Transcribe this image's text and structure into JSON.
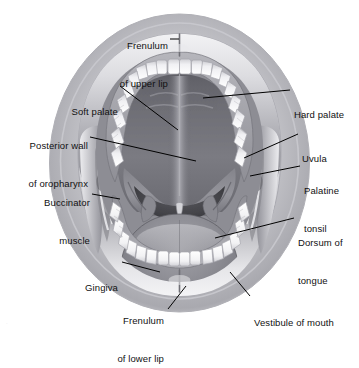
{
  "figure": {
    "type": "anatomical-illustration",
    "style": "grayscale medical illustration",
    "colors": {
      "background": "#ffffff",
      "label_text": "#111111",
      "leader_line": "#000000",
      "lip_light": "#e4e4e6",
      "lip_mid": "#b9b9bd",
      "lip_dark": "#7e7e84",
      "mucosa_mid": "#9a9aa0",
      "mucosa_dark": "#6e6e74",
      "palate_dark": "#636369",
      "tongue_mid": "#8d8d93",
      "tooth": "#fbfbfb",
      "tooth_shadow": "#cfcfd3",
      "cavity_black": "#3a3a3f"
    }
  },
  "labels": [
    {
      "id": "frenulum-upper-lip",
      "lines": [
        "Frenulum",
        "of upper lip"
      ],
      "side": "top",
      "align": "right"
    },
    {
      "id": "soft-palate",
      "lines": [
        "Soft palate"
      ],
      "side": "left",
      "align": "right"
    },
    {
      "id": "posterior-wall-oropharynx",
      "lines": [
        "Posterior wall",
        "of oropharynx"
      ],
      "side": "left",
      "align": "right"
    },
    {
      "id": "buccinator-muscle",
      "lines": [
        "Buccinator",
        "muscle"
      ],
      "side": "left",
      "align": "right"
    },
    {
      "id": "gingiva",
      "lines": [
        "Gingiva"
      ],
      "side": "left",
      "align": "right"
    },
    {
      "id": "frenulum-lower-lip",
      "lines": [
        "Frenulum",
        "of lower lip"
      ],
      "side": "bottom",
      "align": "right"
    },
    {
      "id": "hard-palate",
      "lines": [
        "Hard palate"
      ],
      "side": "right",
      "align": "left"
    },
    {
      "id": "uvula",
      "lines": [
        "Uvula"
      ],
      "side": "right",
      "align": "left"
    },
    {
      "id": "palatine-tonsil",
      "lines": [
        "Palatine",
        "tonsil"
      ],
      "side": "right",
      "align": "left"
    },
    {
      "id": "dorsum-of-tongue",
      "lines": [
        "Dorsum of",
        "tongue"
      ],
      "side": "right",
      "align": "left"
    },
    {
      "id": "vestibule-of-mouth",
      "lines": [
        "Vestibule of mouth"
      ],
      "side": "bottom",
      "align": "left"
    }
  ],
  "label_text": {
    "frenulum_upper_lip_1": "Frenulum",
    "frenulum_upper_lip_2": "of upper lip",
    "soft_palate": "Soft palate",
    "posterior_wall_1": "Posterior wall",
    "posterior_wall_2": "of oropharynx",
    "buccinator_1": "Buccinator",
    "buccinator_2": "muscle",
    "gingiva": "Gingiva",
    "frenulum_lower_lip_1": "Frenulum",
    "frenulum_lower_lip_2": "of lower lip",
    "hard_palate": "Hard palate",
    "uvula": "Uvula",
    "palatine_tonsil_1": "Palatine",
    "palatine_tonsil_2": "tonsil",
    "dorsum_tongue_1": "Dorsum of",
    "dorsum_tongue_2": "tongue",
    "vestibule_of_mouth": "Vestibule of mouth"
  },
  "caption": {
    "clipped_text": "."
  }
}
